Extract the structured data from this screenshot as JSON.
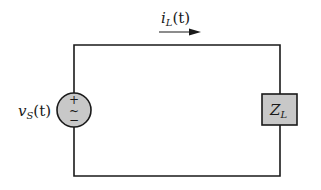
{
  "diagram": {
    "type": "circuit",
    "colors": {
      "wire": "#1a1a1a",
      "component_fill": "#c8c8c8",
      "background": "#ffffff"
    },
    "current": {
      "symbol": "i",
      "subscript": "L",
      "arg": "(t)",
      "direction": "right"
    },
    "source": {
      "symbol": "v",
      "subscript": "S",
      "arg": "(t)",
      "type": "ac-voltage-source",
      "plus": "+",
      "tilde": "~",
      "minus": "−"
    },
    "load": {
      "symbol": "Z",
      "subscript": "L",
      "type": "impedance"
    }
  }
}
